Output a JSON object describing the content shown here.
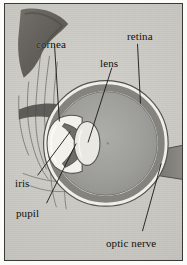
{
  "figure": {
    "kind": "anatomical-diagram",
    "medium": "halftone print on aged paper",
    "frame_color": "#3b3a36",
    "paper_color": "#c9c8c2"
  },
  "labels": [
    {
      "id": "cornea",
      "text": "cornea",
      "leader": "down-right"
    },
    {
      "id": "retina",
      "text": "retina",
      "leader": "down"
    },
    {
      "id": "lens",
      "text": "lens",
      "leader": "down-left"
    },
    {
      "id": "iris",
      "text": "iris",
      "leader": "up-right"
    },
    {
      "id": "pupil",
      "text": "pupil",
      "leader": "up-right"
    },
    {
      "id": "optic_nerve",
      "text": "optic nerve",
      "leader": "up-right"
    }
  ],
  "parts": {
    "sclera_color": "#efeee8",
    "retina_color": "#8d8b87",
    "vitreous_color": "#a3a3a0",
    "iris_color": "#6f6d69",
    "lens_color": "#e8e7e1",
    "optic_nerve_color": "#7f7d78",
    "brow_color": "#5f5c57"
  }
}
